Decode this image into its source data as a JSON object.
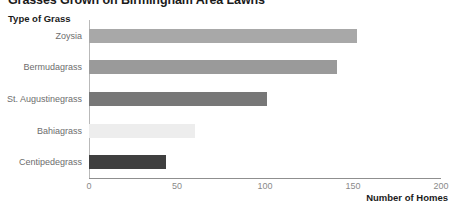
{
  "chart_data": {
    "type": "bar",
    "orientation": "horizontal",
    "title": "Grasses Grown on Birmingham Area Lawns",
    "xlabel": "Number of Homes",
    "ylabel": "Type of Grass",
    "categories": [
      "Zoysia",
      "Bermudagrass",
      "St. Augustinegrass",
      "Bahiagrass",
      "Centipedegrass"
    ],
    "values": [
      152,
      141,
      101,
      60,
      44
    ],
    "bar_colors": [
      "#a8a8a8",
      "#9a9a9a",
      "#777777",
      "#ededed",
      "#3f3f3f"
    ],
    "xlim": [
      0,
      200
    ],
    "xticks": [
      0,
      50,
      100,
      150,
      200
    ],
    "xtick_labels": [
      "0",
      "50",
      "100",
      "150",
      "200"
    ],
    "grid": false,
    "legend": false,
    "series": [
      {
        "name": "Number of Homes",
        "values": [
          152,
          141,
          101,
          60,
          44
        ]
      }
    ]
  },
  "axis": {
    "line_color": "#8f8f8f",
    "tick_label_color": "#8a8a8a",
    "category_label_color": "#6d6d6d"
  }
}
